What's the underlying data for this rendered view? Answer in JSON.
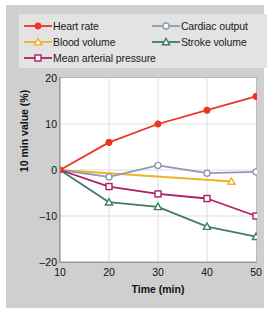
{
  "chart_data": {
    "type": "line",
    "title": "",
    "xlabel": "Time (min)",
    "ylabel": "10 min value (%)",
    "x": [
      10,
      20,
      30,
      40,
      50
    ],
    "xlim": [
      10,
      50
    ],
    "ylim": [
      -20,
      20
    ],
    "xticks": [
      "10",
      "20",
      "30",
      "40",
      "50"
    ],
    "yticks": [
      "20",
      "10",
      "0",
      "–10",
      "–20"
    ],
    "ytick_values": [
      20,
      10,
      0,
      -10,
      -20
    ],
    "grid": true,
    "legend_position": "top",
    "series": [
      {
        "name": "Heart rate",
        "color": "#ee3424",
        "marker": "circle-filled",
        "x": [
          10,
          20,
          30,
          40,
          50
        ],
        "values": [
          0,
          6,
          10,
          13,
          16
        ]
      },
      {
        "name": "Cardiac output",
        "color": "#8e9bb0",
        "marker": "circle-open",
        "x": [
          10,
          20,
          30,
          40,
          50
        ],
        "values": [
          0,
          -1.5,
          1,
          -0.7,
          -0.4
        ]
      },
      {
        "name": "Blood volume",
        "color": "#f0b323",
        "marker": "triangle-open",
        "x": [
          10,
          45
        ],
        "values": [
          0,
          -2.5
        ]
      },
      {
        "name": "Stroke volume",
        "color": "#3f7d68",
        "marker": "triangle-open",
        "x": [
          10,
          20,
          30,
          40,
          50
        ],
        "values": [
          0,
          -7,
          -8,
          -12.3,
          -14.5
        ]
      },
      {
        "name": "Mean arterial pressure",
        "color": "#b01d66",
        "marker": "square-open",
        "x": [
          10,
          20,
          30,
          40,
          50
        ],
        "values": [
          0,
          -3.6,
          -5.2,
          -6.2,
          -10
        ]
      }
    ]
  },
  "legend": {
    "rows": [
      [
        {
          "label": "Heart rate",
          "series": 0
        },
        {
          "label": "Cardiac output",
          "series": 1
        }
      ],
      [
        {
          "label": "Blood volume",
          "series": 2
        },
        {
          "label": "Stroke volume",
          "series": 3
        }
      ],
      [
        {
          "label": "Mean arterial pressure",
          "series": 4
        }
      ]
    ]
  },
  "colors": {
    "figure_background": "#cfcfcf",
    "legend_background": "#e3e3e3",
    "plot_background": "#ffffff",
    "grid": "#d4d4d4",
    "axis": "#9a9a9a",
    "text": "#111111"
  }
}
